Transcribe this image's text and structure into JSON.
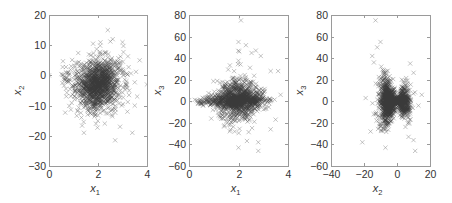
{
  "figure": {
    "width": 452,
    "height": 203,
    "background": "#ffffff",
    "marker_color": "#3a3a3a",
    "axis_color": "#9a9a9a",
    "text_color": "#333333",
    "marker": "x"
  },
  "chart_data": [
    {
      "type": "scatter",
      "title": "",
      "xlabel": "x",
      "xlabel_sub": "1",
      "ylabel": "x",
      "ylabel_sub": "2",
      "xlim": [
        0,
        4
      ],
      "ylim": [
        -30,
        20
      ],
      "xticks": [
        0,
        2,
        4
      ],
      "yticks": [
        -30,
        -20,
        -10,
        0,
        10,
        20
      ],
      "grid": false,
      "legend": null,
      "frame_px": {
        "left": 49,
        "top": 15,
        "right": 147,
        "bottom": 166
      },
      "cloud": {
        "center": [
          2.0,
          -2.5
        ],
        "spread": [
          0.45,
          4.5
        ],
        "count": 1400,
        "shape": "roundish blob, skew to lower-right"
      },
      "outliers": [
        [
          2.4,
          15
        ],
        [
          2.6,
          12
        ],
        [
          3.0,
          11
        ],
        [
          1.8,
          10.5
        ],
        [
          3.7,
          5
        ],
        [
          0.0,
          0
        ],
        [
          3.2,
          -12
        ],
        [
          2.9,
          -17
        ],
        [
          3.4,
          -19
        ],
        [
          2.7,
          -21.5
        ],
        [
          3.5,
          -10
        ],
        [
          3.6,
          -7
        ]
      ]
    },
    {
      "type": "scatter",
      "title": "",
      "xlabel": "x",
      "xlabel_sub": "1",
      "ylabel": "x",
      "ylabel_sub": "3",
      "xlim": [
        0,
        4
      ],
      "ylim": [
        -60,
        80
      ],
      "xticks": [
        0,
        2,
        4
      ],
      "yticks": [
        -60,
        -40,
        -20,
        0,
        20,
        40,
        60,
        80
      ],
      "grid": false,
      "legend": null,
      "frame_px": {
        "left": 189,
        "top": 15,
        "right": 288,
        "bottom": 166
      },
      "cloud": {
        "center": [
          2.0,
          0
        ],
        "spread": [
          0.5,
          9
        ],
        "count": 1400,
        "shape": "diamond, wide horizontal band near 0"
      },
      "outliers": [
        [
          2.1,
          75
        ],
        [
          2.0,
          55
        ],
        [
          2.3,
          52
        ],
        [
          2.7,
          47
        ],
        [
          2.9,
          42
        ],
        [
          3.3,
          28
        ],
        [
          3.6,
          28
        ],
        [
          3.7,
          6
        ],
        [
          0.0,
          1
        ],
        [
          0.9,
          -16
        ],
        [
          3.5,
          -17
        ],
        [
          3.3,
          -26
        ],
        [
          2.0,
          -43
        ],
        [
          2.8,
          -46
        ],
        [
          2.8,
          -38
        ]
      ]
    },
    {
      "type": "scatter",
      "title": "",
      "xlabel": "x",
      "xlabel_sub": "2",
      "ylabel": "x",
      "ylabel_sub": "3",
      "xlim": [
        -40,
        20
      ],
      "ylim": [
        -60,
        80
      ],
      "xticks": [
        -40,
        -20,
        0,
        20
      ],
      "yticks": [
        -60,
        -40,
        -20,
        0,
        20,
        40,
        60,
        80
      ],
      "grid": false,
      "legend": null,
      "frame_px": {
        "left": 331,
        "top": 15,
        "right": 430,
        "bottom": 166
      },
      "cloud": {
        "center": [
          -2,
          0
        ],
        "spread": [
          4,
          12
        ],
        "count": 1400,
        "shape": "two vertical lobes (bowtie) pinched near x2=0"
      },
      "outliers": [
        [
          -13,
          75
        ],
        [
          -10,
          55
        ],
        [
          -12,
          50
        ],
        [
          -15,
          42
        ],
        [
          -14,
          36
        ],
        [
          8,
          35
        ],
        [
          15,
          6
        ],
        [
          13,
          -4
        ],
        [
          -19,
          3
        ],
        [
          -16,
          -28
        ],
        [
          -21,
          -38
        ],
        [
          10,
          -36
        ],
        [
          7,
          -33
        ],
        [
          11,
          -46
        ],
        [
          -7,
          -43
        ]
      ]
    }
  ]
}
